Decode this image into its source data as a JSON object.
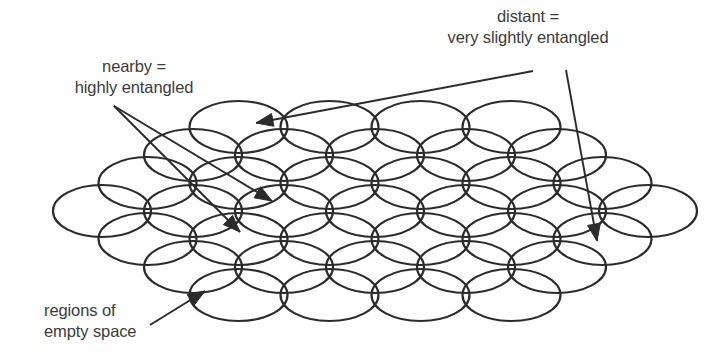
{
  "figure": {
    "title_text": "",
    "background_color": "#ffffff",
    "stroke_color": "#2b2b2b",
    "text_color": "#3b3b3b",
    "annotations": {
      "nearby": {
        "line1": "nearby =",
        "line2": "highly entangled"
      },
      "distant": {
        "line1": "distant =",
        "line2": "very slightly entangled"
      },
      "regions": {
        "line1": "regions of",
        "line2": "empty space"
      }
    }
  },
  "chart_data": {
    "type": "diagram",
    "title": "",
    "lattice": {
      "rows": 7,
      "counts_per_row": [
        4,
        5,
        6,
        7,
        6,
        5,
        4
      ],
      "ellipse_rx": 49,
      "ellipse_ry": 26,
      "row_spacing": 28,
      "col_spacing": 91,
      "center_x": 375,
      "first_row_center_y": 127
    },
    "arrows": [
      {
        "name": "nearby-arrow-1",
        "from": [
          114,
          106
        ],
        "to": [
          272,
          201
        ]
      },
      {
        "name": "nearby-arrow-2",
        "from": [
          114,
          106
        ],
        "to": [
          240,
          232
        ]
      },
      {
        "name": "distant-arrow-long",
        "from": [
          533,
          71
        ],
        "to": [
          256,
          123
        ]
      },
      {
        "name": "distant-arrow-short",
        "from": [
          566,
          70
        ],
        "to": [
          597,
          241
        ]
      },
      {
        "name": "regions-arrow",
        "from": [
          150,
          325
        ],
        "to": [
          205,
          291
        ]
      }
    ]
  }
}
